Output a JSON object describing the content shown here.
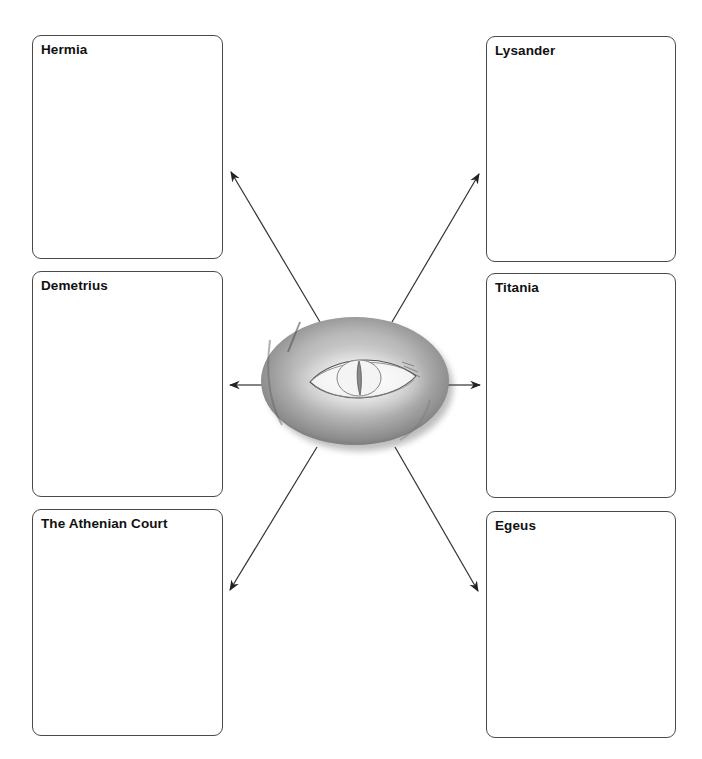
{
  "diagram": {
    "center_image": "cat-eye-illustration",
    "boxes": [
      {
        "id": "hermia",
        "label": "Hermia"
      },
      {
        "id": "lysander",
        "label": "Lysander"
      },
      {
        "id": "demetrius",
        "label": "Demetrius"
      },
      {
        "id": "titania",
        "label": "Titania"
      },
      {
        "id": "athenian-court",
        "label": "The Athenian Court"
      },
      {
        "id": "egeus",
        "label": "Egeus"
      }
    ]
  }
}
